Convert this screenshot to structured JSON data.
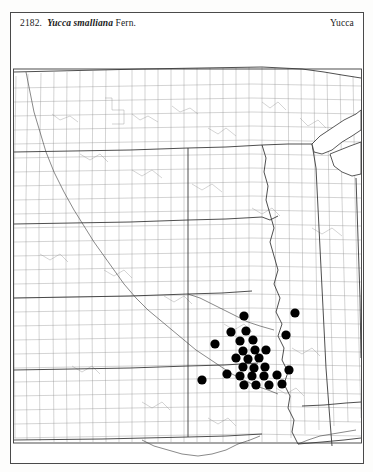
{
  "page": {
    "background_color": "#ffffff",
    "plate_border_color": "#4a4a4a"
  },
  "header": {
    "entry_number": "2182.",
    "species_name": "Yucca smalliana",
    "authority": "Fern.",
    "genus_label": "Yucca"
  },
  "map": {
    "name": "county-distribution-map",
    "region": "central-united-states",
    "county_line_color": "#8d8d8d",
    "state_line_color": "#2f2f2f",
    "river_line_color": "#3a3a3a",
    "dot_color": "#000000",
    "dot_radius": 4.6,
    "viewbox": "0 0 352 406",
    "occurrence_dots": [
      {
        "id": "dot-01",
        "x": 232,
        "y": 258
      },
      {
        "id": "dot-02",
        "x": 283,
        "y": 255
      },
      {
        "id": "dot-03",
        "x": 219,
        "y": 274
      },
      {
        "id": "dot-04",
        "x": 234,
        "y": 273
      },
      {
        "id": "dot-05",
        "x": 274,
        "y": 277
      },
      {
        "id": "dot-06",
        "x": 203,
        "y": 286
      },
      {
        "id": "dot-07",
        "x": 228,
        "y": 283
      },
      {
        "id": "dot-08",
        "x": 241,
        "y": 282
      },
      {
        "id": "dot-09",
        "x": 231,
        "y": 293
      },
      {
        "id": "dot-10",
        "x": 243,
        "y": 292
      },
      {
        "id": "dot-11",
        "x": 254,
        "y": 292
      },
      {
        "id": "dot-12",
        "x": 224,
        "y": 300
      },
      {
        "id": "dot-13",
        "x": 236,
        "y": 301
      },
      {
        "id": "dot-14",
        "x": 247,
        "y": 300
      },
      {
        "id": "dot-15",
        "x": 231,
        "y": 309
      },
      {
        "id": "dot-16",
        "x": 242,
        "y": 310
      },
      {
        "id": "dot-17",
        "x": 253,
        "y": 309
      },
      {
        "id": "dot-18",
        "x": 215,
        "y": 316
      },
      {
        "id": "dot-19",
        "x": 228,
        "y": 318
      },
      {
        "id": "dot-20",
        "x": 240,
        "y": 318
      },
      {
        "id": "dot-21",
        "x": 252,
        "y": 318
      },
      {
        "id": "dot-22",
        "x": 265,
        "y": 317
      },
      {
        "id": "dot-23",
        "x": 277,
        "y": 312
      },
      {
        "id": "dot-24",
        "x": 190,
        "y": 322
      },
      {
        "id": "dot-25",
        "x": 232,
        "y": 327
      },
      {
        "id": "dot-26",
        "x": 244,
        "y": 327
      },
      {
        "id": "dot-27",
        "x": 257,
        "y": 327
      },
      {
        "id": "dot-28",
        "x": 270,
        "y": 326
      }
    ]
  }
}
